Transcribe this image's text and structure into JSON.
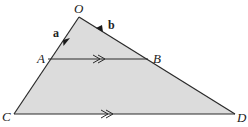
{
  "diagram": {
    "type": "geometry-triangle-with-parallel-lines",
    "points": {
      "O": {
        "label": "O",
        "x": 79,
        "y": 17
      },
      "A": {
        "label": "A",
        "x": 48,
        "y": 59
      },
      "B": {
        "label": "B",
        "x": 148,
        "y": 59
      },
      "C": {
        "label": "C",
        "x": 14,
        "y": 114
      },
      "D": {
        "label": "D",
        "x": 235,
        "y": 114
      }
    },
    "vectors": [
      {
        "name": "a",
        "label": "a",
        "along": "OA"
      },
      {
        "name": "b",
        "label": "b",
        "along": "OB"
      }
    ],
    "parallel_markers": [
      {
        "segment": "AB",
        "marker": "double-arrow"
      },
      {
        "segment": "CD",
        "marker": "double-arrow"
      }
    ],
    "colors": {
      "fill": "#dcdcdc",
      "stroke": "#2a2a2a",
      "background": "#ffffff"
    }
  }
}
